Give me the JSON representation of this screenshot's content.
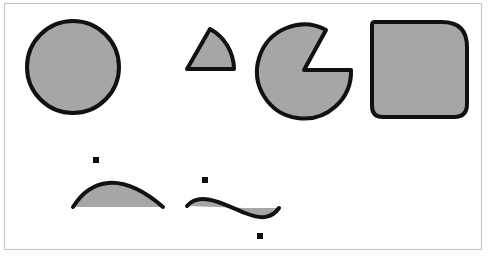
{
  "canvas": {
    "width": 488,
    "height": 260,
    "background": "#ffffff"
  },
  "frame": {
    "x": 4,
    "y": 3,
    "width": 477,
    "height": 246,
    "stroke": "#c8c8c8"
  },
  "style": {
    "fill": "#a6a6a6",
    "stroke": "#111111",
    "stroke_width": 4,
    "dot_color": "#111111"
  },
  "shapes": [
    {
      "name": "circle",
      "type": "circle",
      "cx": 73,
      "cy": 67,
      "r": 46
    },
    {
      "name": "pie-wedge",
      "type": "path",
      "d": "M 187 69 L 210 29 A 46 46 0 0 1 234 69 Z"
    },
    {
      "name": "pacman",
      "type": "path",
      "d": "M 304 70 L 326 30 A 47 47 0 1 0 351 70 Z"
    },
    {
      "name": "rounded-square",
      "type": "path",
      "d": "M 375 22 L 442 22 Q 467 22 467 47 L 467 104 Q 467 117 454 117 L 383 117 Q 372 117 372 106 L 372 25 Q 372 22 375 22 Z"
    }
  ],
  "curves": [
    {
      "name": "bezier-hump",
      "fill_d": "M 73 207 C 90 180, 120 170, 163 207 Z",
      "stroke_d": "M 73 207 C 90 180, 120 170, 163 207"
    },
    {
      "name": "bezier-s-curve",
      "fill_d": "M 187 206 C 200 190, 225 205, 245 213 C 262 219, 272 216, 279 208 L 245 208 Z",
      "stroke_d": "M 187 206 C 200 190, 225 205, 245 213 C 262 220, 272 218, 279 208"
    }
  ],
  "control_points": [
    {
      "name": "control-point-hump",
      "x": 96,
      "y": 160
    },
    {
      "name": "control-point-s-1",
      "x": 205,
      "y": 180
    },
    {
      "name": "control-point-s-2",
      "x": 260,
      "y": 236
    }
  ]
}
